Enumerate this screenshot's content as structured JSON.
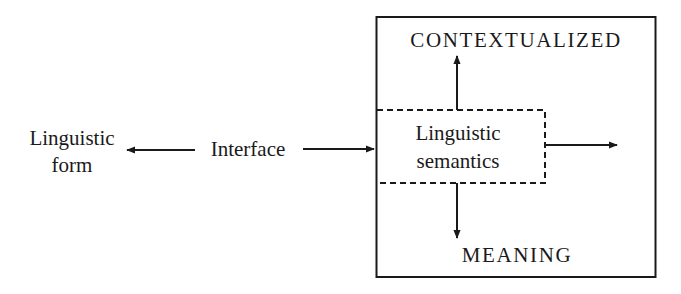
{
  "diagram": {
    "left_label": {
      "line1": "Linguistic",
      "line2": "form"
    },
    "middle_label": "Interface",
    "outer_box": {
      "top_label": "CONTEXTUALIZED",
      "bottom_label": "MEANING"
    },
    "inner_box": {
      "line1": "Linguistic",
      "line2": "semantics",
      "border_style": "dashed"
    },
    "arrows": [
      {
        "from": "Interface",
        "to": "Linguistic form",
        "direction": "left"
      },
      {
        "from": "Interface",
        "to": "Linguistic semantics",
        "direction": "right"
      },
      {
        "from": "Linguistic semantics",
        "to": "CONTEXTUALIZED",
        "direction": "up"
      },
      {
        "from": "Linguistic semantics",
        "to": "MEANING",
        "direction": "down"
      },
      {
        "from": "Linguistic semantics",
        "to": "outside (right)",
        "direction": "right"
      }
    ],
    "colors": {
      "ink": "#1a1a1a",
      "background": "#ffffff"
    }
  }
}
